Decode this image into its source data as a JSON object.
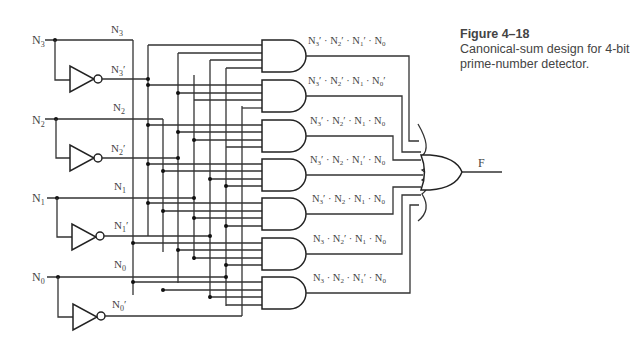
{
  "caption": {
    "figure_label": "Figure 4–18",
    "description": "Canonical-sum design for 4-bit prime-number detector."
  },
  "inputs": [
    {
      "name": "N3",
      "label": "N",
      "sub": "3",
      "complement_label": "N",
      "complement_sub": "3",
      "prime": "′"
    },
    {
      "name": "N2",
      "label": "N",
      "sub": "2",
      "complement_label": "N",
      "complement_sub": "2",
      "prime": "′"
    },
    {
      "name": "N1",
      "label": "N",
      "sub": "1",
      "complement_label": "N",
      "complement_sub": "1",
      "prime": "′"
    },
    {
      "name": "N0",
      "label": "N",
      "sub": "0",
      "complement_label": "N",
      "complement_sub": "0",
      "prime": "′"
    }
  ],
  "and_gates": [
    {
      "term": "N3′ · N2′ · N1′ · N0"
    },
    {
      "term": "N3′ · N2′ · N1 · N0′"
    },
    {
      "term": "N3′ · N2′ · N1 · N0"
    },
    {
      "term": "N3′ · N2 · N1′ · N0"
    },
    {
      "term": "N3′ · N2 · N1 · N0"
    },
    {
      "term": "N3 · N2′ · N1 · N0"
    },
    {
      "term": "N3 · N2 · N1′ · N0"
    }
  ],
  "or_gate": {
    "output_label": "F"
  }
}
